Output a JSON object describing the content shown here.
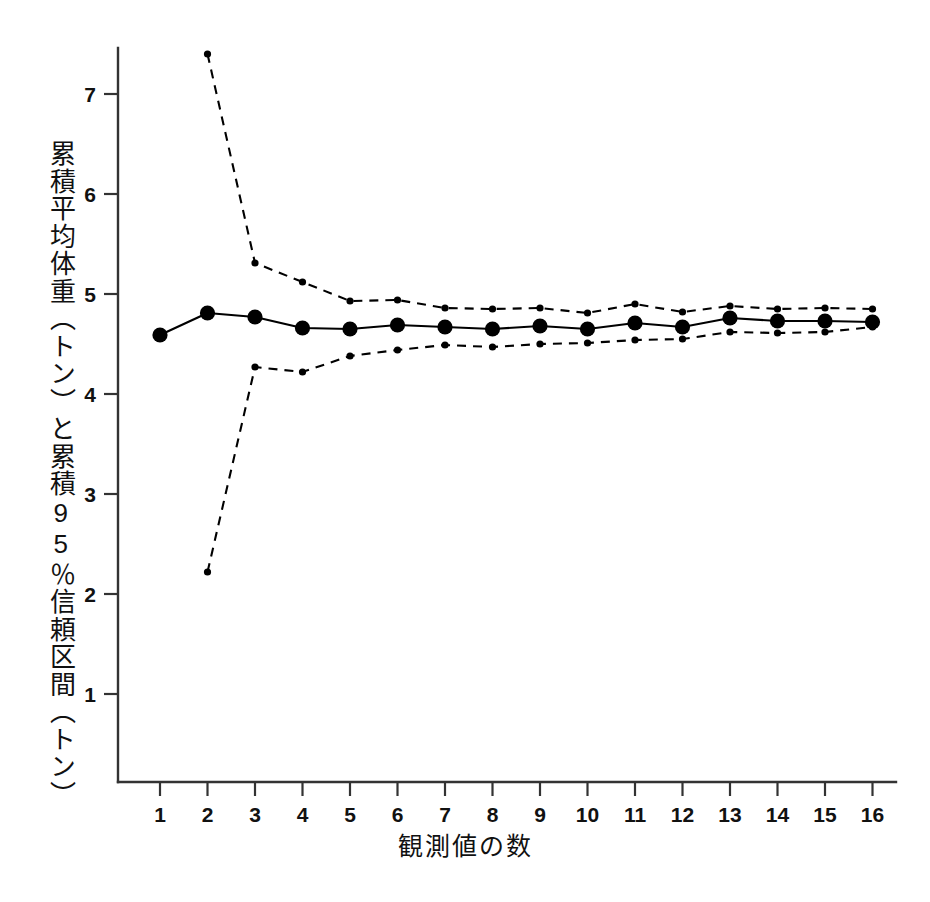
{
  "chart_data": {
    "type": "line",
    "title": "",
    "subtitle": "",
    "xlabel": "観測値の数",
    "ylabel": "累積平均体重（トン）と累積95％信頼区間（トン）",
    "x": [
      1,
      2,
      3,
      4,
      5,
      6,
      7,
      8,
      9,
      10,
      11,
      12,
      13,
      14,
      15,
      16
    ],
    "xtick_labels": [
      "1",
      "2",
      "3",
      "4",
      "5",
      "6",
      "7",
      "8",
      "9",
      "10",
      "11",
      "12",
      "13",
      "14",
      "15",
      "16"
    ],
    "ytick_labels": [
      "1",
      "2",
      "3",
      "4",
      "5",
      "6",
      "7"
    ],
    "yticks": [
      1,
      2,
      3,
      4,
      5,
      6,
      7
    ],
    "xlim": [
      0.4,
      16.6
    ],
    "ylim": [
      0.35,
      7.75
    ],
    "grid": false,
    "legend": "none",
    "series": [
      {
        "name": "累積平均体重",
        "style": "solid",
        "marker": "filled-circle",
        "marker_size": "large",
        "color": "#000000",
        "values": [
          4.59,
          4.81,
          4.77,
          4.66,
          4.65,
          4.69,
          4.67,
          4.65,
          4.68,
          4.65,
          4.71,
          4.67,
          4.76,
          4.73,
          4.73,
          4.72
        ]
      },
      {
        "name": "累積95％信頼区間 上限",
        "style": "dashed",
        "marker": "small-dot",
        "marker_size": "small",
        "color": "#000000",
        "values": [
          null,
          7.4,
          5.31,
          5.12,
          4.93,
          4.94,
          4.86,
          4.85,
          4.86,
          4.81,
          4.9,
          4.82,
          4.88,
          4.85,
          4.86,
          4.85
        ]
      },
      {
        "name": "累積95％信頼区間 下限",
        "style": "dashed",
        "marker": "small-dot",
        "marker_size": "small",
        "color": "#000000",
        "values": [
          null,
          2.22,
          4.27,
          4.22,
          4.38,
          4.44,
          4.49,
          4.47,
          4.5,
          4.51,
          4.54,
          4.55,
          4.62,
          4.61,
          4.62,
          4.67
        ]
      }
    ]
  },
  "axes": {
    "y_axis_name": "cumulative-mean-weight-axis",
    "x_axis_name": "observation-count-axis"
  }
}
